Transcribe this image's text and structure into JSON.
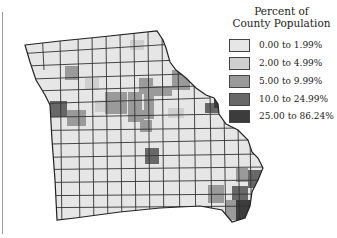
{
  "legend": {
    "title_line1": "Percent of",
    "title_line2": "County Population",
    "items": [
      {
        "label": "0.00 to 1.99%",
        "color": "#e6e6e6"
      },
      {
        "label": "2.00 to 4.99%",
        "color": "#cfcfcf"
      },
      {
        "label": "5.00 to 9.99%",
        "color": "#9a9a9a"
      },
      {
        "label": "10.0 to 24.99%",
        "color": "#686868"
      },
      {
        "label": "25.00 to 86.24%",
        "color": "#3c3c3c"
      }
    ]
  },
  "map": {
    "region": "Missouri counties",
    "border_color": "#333333"
  }
}
